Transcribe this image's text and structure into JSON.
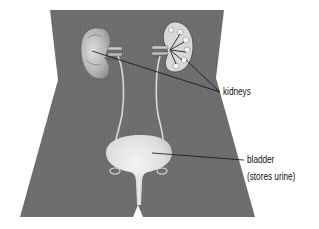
{
  "diagram": {
    "colors": {
      "background": "#ffffff",
      "body": "#717171",
      "organ": "#e6e6e6",
      "leader_line": "#111111",
      "text": "#111111"
    },
    "labels": [
      {
        "id": "kidneys",
        "text": "kidneys",
        "targets": [
          "left-kidney",
          "right-kidney"
        ]
      },
      {
        "id": "bladder",
        "text": "bladder",
        "sub_text": "(stores urine)",
        "targets": [
          "bladder"
        ]
      }
    ],
    "organs": [
      "left-kidney",
      "right-kidney",
      "left-ureter",
      "right-ureter",
      "bladder",
      "urethra"
    ]
  }
}
